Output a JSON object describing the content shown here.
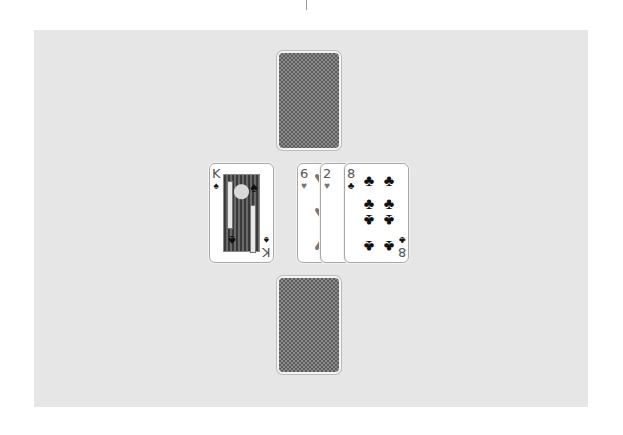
{
  "game": {
    "title": "Card table",
    "table_color": "#e6e6e6"
  },
  "opponent_top": {
    "label": "Top player hand",
    "card": {
      "face": "down",
      "icon": "card-back-pattern"
    }
  },
  "opponent_bottom": {
    "label": "Bottom player hand",
    "card": {
      "face": "down",
      "icon": "card-back-pattern"
    }
  },
  "left_pile": {
    "label": "Left played card",
    "card": {
      "rank": "K",
      "suit": "♠",
      "suit_name": "spades",
      "color": "black"
    }
  },
  "right_pile": {
    "label": "Right played cards",
    "cards": [
      {
        "rank": "6",
        "suit": "♥",
        "suit_name": "hearts",
        "color": "red"
      },
      {
        "rank": "2",
        "suit": "♥",
        "suit_name": "hearts",
        "color": "red"
      },
      {
        "rank": "8",
        "suit": "♣",
        "suit_name": "clubs",
        "color": "black"
      }
    ]
  }
}
